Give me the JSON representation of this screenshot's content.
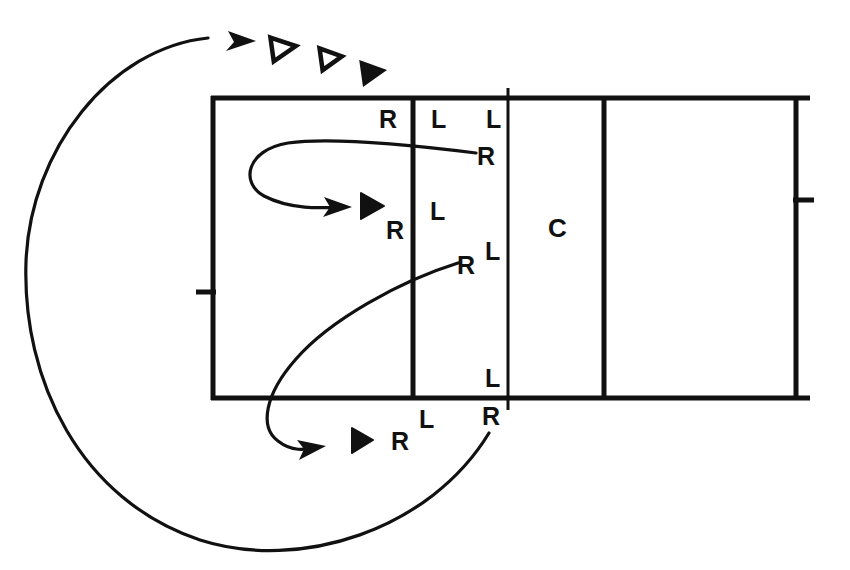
{
  "diagram": {
    "stroke_color": "#111111",
    "background_color": "#ffffff",
    "box": {
      "left": 213,
      "top": 98,
      "right": 796,
      "bottom": 398,
      "outer_line_width": 5,
      "top_overhang_right": 14,
      "bottom_overhang_right": 14
    },
    "dividers": [
      {
        "name": "divider-1",
        "x": 413,
        "width": 5,
        "top": 98,
        "bottom": 398
      },
      {
        "name": "divider-2",
        "x": 508,
        "width": 3,
        "top": 88,
        "bottom": 410
      },
      {
        "name": "divider-3",
        "x": 604,
        "width": 5,
        "top": 98,
        "bottom": 398
      }
    ],
    "ticks": [
      {
        "name": "tick-left",
        "x1": 196,
        "x2": 215,
        "y": 292,
        "width": 5
      },
      {
        "name": "tick-right",
        "x1": 794,
        "x2": 814,
        "y": 200,
        "width": 5
      }
    ],
    "labels": [
      {
        "id": "r-top-left",
        "text": "R",
        "x": 385,
        "y": 120,
        "size": 25
      },
      {
        "id": "l-top-mid",
        "text": "L",
        "x": 437,
        "y": 120,
        "size": 25
      },
      {
        "id": "l-top-right",
        "text": "L",
        "x": 492,
        "y": 120,
        "size": 25
      },
      {
        "id": "r-upper-curve",
        "text": "R",
        "x": 483,
        "y": 157,
        "size": 25
      },
      {
        "id": "r-mid-left",
        "text": "R",
        "x": 393,
        "y": 231,
        "size": 25
      },
      {
        "id": "l-mid",
        "text": "L",
        "x": 436,
        "y": 212,
        "size": 25
      },
      {
        "id": "r-lower-curve",
        "text": "R",
        "x": 464,
        "y": 266,
        "size": 25
      },
      {
        "id": "l-mid-right",
        "text": "L",
        "x": 491,
        "y": 252,
        "size": 25
      },
      {
        "id": "l-bottom-in",
        "text": "L",
        "x": 491,
        "y": 379,
        "size": 25
      },
      {
        "id": "l-bottom-out",
        "text": "L",
        "x": 426,
        "y": 420,
        "size": 25
      },
      {
        "id": "r-bottom-out",
        "text": "R",
        "x": 489,
        "y": 417,
        "size": 25
      },
      {
        "id": "r-bottom-arrow",
        "text": "R",
        "x": 398,
        "y": 442,
        "size": 25
      },
      {
        "id": "c-center",
        "text": "C",
        "x": 550,
        "y": 229,
        "size": 26
      }
    ],
    "triangles": [
      {
        "id": "triangle-hollow-1",
        "filled": false,
        "cx": 282,
        "cy": 48,
        "size": 20,
        "rotation": -8
      },
      {
        "id": "triangle-hollow-2",
        "filled": false,
        "cx": 330,
        "cy": 58,
        "size": 17,
        "rotation": -8
      },
      {
        "id": "triangle-filled-top",
        "filled": true,
        "cx": 372,
        "cy": 72,
        "size": 19,
        "rotation": -8
      },
      {
        "id": "triangle-filled-upper-loop",
        "filled": true,
        "cx": 371,
        "cy": 206,
        "size": 19,
        "rotation": 0
      },
      {
        "id": "triangle-filled-lower-loop",
        "filled": true,
        "cx": 361,
        "cy": 440,
        "size": 19,
        "rotation": 0
      }
    ],
    "arrows": [
      {
        "id": "outer-recirculation-arc",
        "from_label": "r-bottom-out",
        "to_label": "top-triangles",
        "path": "M 489 433 C 430 530 300 572 200 540 C 80 500 22 380 26 262 C 30 150 110 48 208 38",
        "arrowhead": {
          "x": 252,
          "y": 42,
          "angle": -12
        }
      },
      {
        "id": "upper-loop-arrow",
        "from_label": "r-upper-curve",
        "to_label": "triangle-filled-upper-loop",
        "path": "M 474 153 C 420 146 330 138 288 144 C 246 151 243 182 266 195 C 292 209 322 208 341 207",
        "arrowhead": {
          "x": 348,
          "y": 207,
          "angle": 2
        }
      },
      {
        "id": "lower-loop-arrow",
        "from_label": "r-lower-curve",
        "to_label": "triangle-filled-lower-loop",
        "path": "M 456 263 C 400 281 330 321 296 360 C 266 393 260 426 278 441 C 292 452 307 450 314 447",
        "arrowhead": {
          "x": 322,
          "y": 446,
          "angle": 14
        }
      }
    ]
  }
}
